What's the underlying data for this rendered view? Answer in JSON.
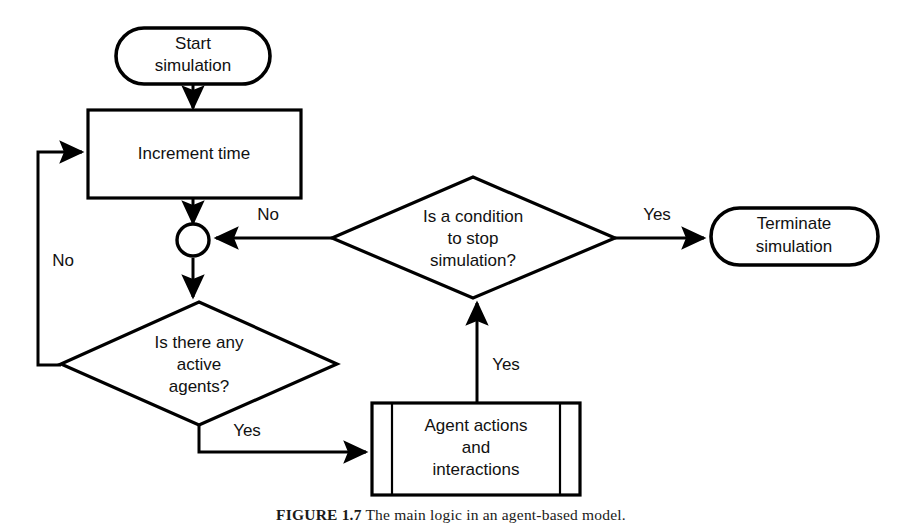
{
  "figure": {
    "type": "flowchart",
    "background_color": "#ffffff",
    "line_color": "#000000",
    "text_color": "#111111",
    "caption_label": "FIGURE 1.7",
    "caption_text": "The main logic in an agent-based model."
  },
  "nodes": {
    "start": {
      "shape": "rounded-terminator",
      "line1": "Start",
      "line2": "simulation"
    },
    "increment": {
      "shape": "rectangle",
      "line1": "Increment time"
    },
    "merge": {
      "shape": "circle-connector",
      "label": ""
    },
    "active_agents": {
      "shape": "diamond",
      "line1": "Is there any",
      "line2": "active",
      "line3": "agents?"
    },
    "agent_actions": {
      "shape": "predefined-process",
      "line1": "Agent actions",
      "line2": "and",
      "line3": "interactions"
    },
    "stop_condition": {
      "shape": "diamond",
      "line1": "Is a condition",
      "line2": "to stop",
      "line3": "simulation?"
    },
    "terminate": {
      "shape": "rounded-terminator",
      "line1": "Terminate",
      "line2": "simulation"
    }
  },
  "edge_labels": {
    "no_loopback": "No",
    "no_to_merge": "No",
    "yes_to_actions": "Yes",
    "yes_to_condition": "Yes",
    "yes_to_terminate": "Yes"
  }
}
